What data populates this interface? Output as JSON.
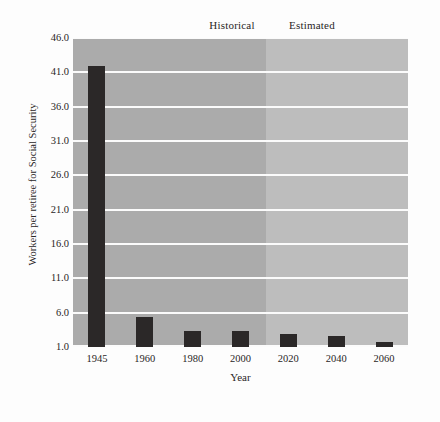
{
  "chart_data": {
    "type": "bar",
    "title": "",
    "xlabel": "Year",
    "ylabel": "Workers per retiree for Social Security",
    "categories": [
      "1945",
      "1960",
      "1980",
      "2000",
      "2020",
      "2040",
      "2060"
    ],
    "values": [
      41.9,
      5.4,
      3.4,
      3.4,
      2.9,
      2.6,
      1.8
    ],
    "ylim": [
      1.0,
      46.0
    ],
    "yticks": [
      "1.0",
      "6.0",
      "11.0",
      "16.0",
      "21.0",
      "26.0",
      "31.0",
      "36.0",
      "41.0",
      "46.0"
    ],
    "ytick_values": [
      1.0,
      6.0,
      11.0,
      16.0,
      21.0,
      26.0,
      31.0,
      36.0,
      41.0,
      46.0
    ],
    "grid": true,
    "legend_position": "above-plot",
    "bands": [
      {
        "label": "Historical",
        "start_category": "1945",
        "end_category": "2000",
        "color": "#ababab"
      },
      {
        "label": "Estimated",
        "start_category": "2020",
        "end_category": "2060",
        "color": "#bdbdbd"
      }
    ],
    "bar_color": "#2b2828",
    "gridline_color": "#fbfbfb",
    "background": "#fdfdfd"
  },
  "axes": {
    "xlabel": "Year",
    "ylabel": "Workers per retiree for Social Security"
  },
  "bands": {
    "historical_label": "Historical",
    "estimated_label": "Estimated"
  }
}
